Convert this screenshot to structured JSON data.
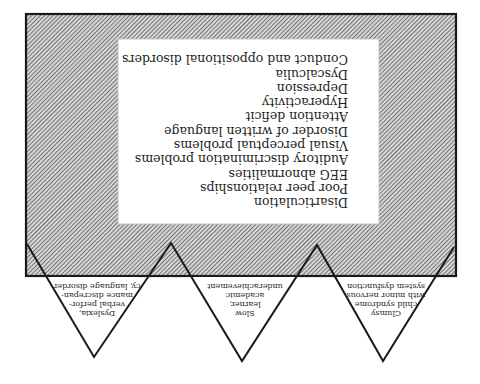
{
  "figure": {
    "orientation": "rotated-180",
    "outer_box": {
      "fill_pattern": "diagonal-hatch",
      "hatch_color": "#555555",
      "background": "#d8d8d8",
      "border_color": "#1a1a1a"
    },
    "inner_box": {
      "background": "#ffffff"
    },
    "characteristics": [
      "Disarticulation",
      "Poor peer relationships",
      "EEG abnormalities",
      "Auditory discrimination problems",
      "Visual perceptual problems",
      "Disorder of written language",
      "Attention deficit",
      "Hyperactivity",
      "Depression",
      "Dyscalculia",
      "Conduct and oppositional disorders"
    ],
    "subgroups": [
      {
        "lines": [
          "Clumsy",
          "child syndrome",
          "with minor nervous",
          "system dysfunction"
        ]
      },
      {
        "lines": [
          "Slow",
          "learner,",
          "academic",
          "underachievement"
        ]
      },
      {
        "lines": [
          "Dyslexia,",
          "verbal perfor-",
          "mance discrepan-",
          "cy, language disorder"
        ]
      }
    ]
  }
}
